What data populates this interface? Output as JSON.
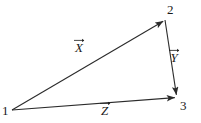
{
  "figure": {
    "kind": "vector-triangle-diagram",
    "background_color": "#ffffff",
    "stroke_color": "#2b2b2b",
    "text_color": "#1a1a1a"
  },
  "vertices": [
    {
      "id": "1",
      "label": "1",
      "x": 12,
      "y": 110
    },
    {
      "id": "2",
      "label": "2",
      "x": 165,
      "y": 20
    },
    {
      "id": "3",
      "label": "3",
      "x": 177,
      "y": 97
    }
  ],
  "vectors": [
    {
      "id": "X",
      "glyph": "X",
      "label": "X",
      "accent": "vector-arrow",
      "from": "1",
      "to": "2",
      "arrowhead_at": "2"
    },
    {
      "id": "Y",
      "glyph": "Y",
      "label": "Y",
      "accent": "vector-arrow",
      "from": "2",
      "to": "3",
      "arrowhead_at": "3"
    },
    {
      "id": "Z",
      "glyph": "Z",
      "label": "Z",
      "accent": "vector-arrow",
      "from": "1",
      "to": "3",
      "arrowhead_at": "3"
    }
  ]
}
